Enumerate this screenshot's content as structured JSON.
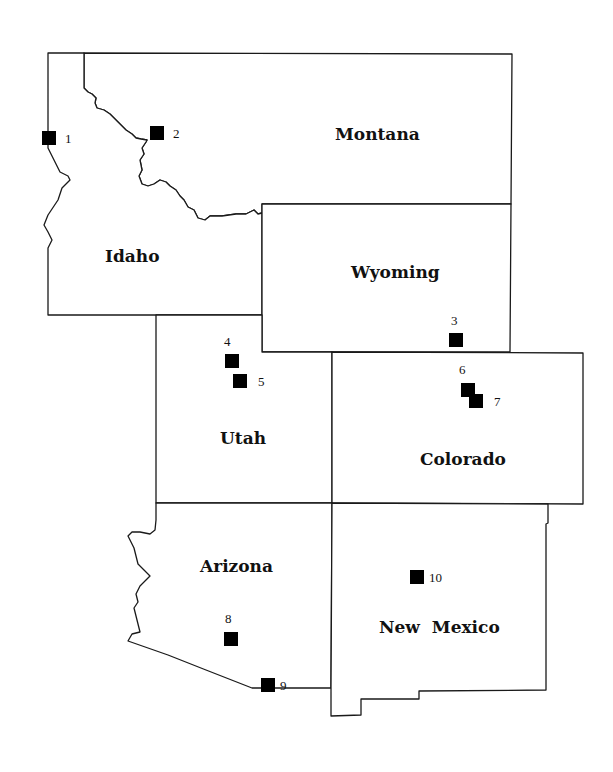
{
  "map": {
    "type": "regional-state-map",
    "colors": {
      "background": "#ffffff",
      "border": "#1a1a1a",
      "marker": "#000000",
      "text": "#111111"
    },
    "states": [
      {
        "id": "idaho",
        "label": "Idaho"
      },
      {
        "id": "montana",
        "label": "Montana"
      },
      {
        "id": "wyoming",
        "label": "Wyoming"
      },
      {
        "id": "utah",
        "label": "Utah"
      },
      {
        "id": "colorado",
        "label": "Colorado"
      },
      {
        "id": "arizona",
        "label": "Arizona"
      },
      {
        "id": "new-mexico",
        "label": "New  Mexico"
      }
    ],
    "sites": [
      {
        "number": "1",
        "state": "Idaho"
      },
      {
        "number": "2",
        "state": "Montana"
      },
      {
        "number": "3",
        "state": "Wyoming"
      },
      {
        "number": "4",
        "state": "Utah"
      },
      {
        "number": "5",
        "state": "Utah"
      },
      {
        "number": "6",
        "state": "Colorado"
      },
      {
        "number": "7",
        "state": "Colorado"
      },
      {
        "number": "8",
        "state": "Arizona"
      },
      {
        "number": "9",
        "state": "Arizona"
      },
      {
        "number": "10",
        "state": "New Mexico"
      }
    ],
    "marker_icon": "filled-square-icon"
  }
}
